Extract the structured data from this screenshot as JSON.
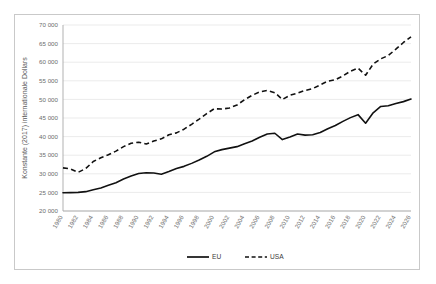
{
  "chart_data": {
    "type": "line",
    "title": "",
    "xlabel": "",
    "ylabel": "Konstante (2017) internationale Dollars",
    "ylim": [
      20000,
      70000
    ],
    "ytick_step": 5000,
    "ytick_labels": [
      "20 000",
      "25 000",
      "30 000",
      "35 000",
      "40 000",
      "45 000",
      "50 000",
      "55 000",
      "60 000",
      "65 000",
      "70 000"
    ],
    "ytick_values": [
      20000,
      25000,
      30000,
      35000,
      40000,
      45000,
      50000,
      55000,
      60000,
      65000,
      70000
    ],
    "grid": true,
    "legend_position": "bottom",
    "x": [
      1980,
      1981,
      1982,
      1983,
      1984,
      1985,
      1986,
      1987,
      1988,
      1989,
      1990,
      1991,
      1992,
      1993,
      1994,
      1995,
      1996,
      1997,
      1998,
      1999,
      2000,
      2001,
      2002,
      2003,
      2004,
      2005,
      2006,
      2007,
      2008,
      2009,
      2010,
      2011,
      2012,
      2013,
      2014,
      2015,
      2016,
      2017,
      2018,
      2019,
      2020,
      2021,
      2022,
      2023,
      2024,
      2025,
      2026
    ],
    "xtick_labels": [
      "1980",
      "1982",
      "1984",
      "1986",
      "1988",
      "1990",
      "1992",
      "1994",
      "1996",
      "1998",
      "2000",
      "2002",
      "2004",
      "2006",
      "2008",
      "2010",
      "2012",
      "2014",
      "2016",
      "2018",
      "2020",
      "2022",
      "2024",
      "2026"
    ],
    "series": [
      {
        "name": "EU",
        "style": "solid",
        "color": "#111111",
        "values": [
          24900,
          24950,
          25000,
          25200,
          25700,
          26200,
          26900,
          27600,
          28600,
          29400,
          30100,
          30300,
          30200,
          29900,
          30600,
          31400,
          32000,
          32800,
          33700,
          34700,
          35900,
          36500,
          36900,
          37300,
          38100,
          38800,
          39800,
          40700,
          40900,
          39200,
          39900,
          40700,
          40400,
          40500,
          41100,
          42100,
          43000,
          44100,
          45100,
          45900,
          43600,
          46400,
          48100,
          48300,
          48900,
          49400,
          50100
        ]
      },
      {
        "name": "USA",
        "style": "dashed",
        "color": "#111111",
        "values": [
          31600,
          31300,
          30400,
          31400,
          33300,
          34300,
          35100,
          36100,
          37300,
          38200,
          38500,
          38000,
          38800,
          39400,
          40500,
          41000,
          42000,
          43300,
          44700,
          46200,
          47500,
          47400,
          47700,
          48500,
          49900,
          51100,
          52000,
          52400,
          51800,
          50000,
          51100,
          51700,
          52400,
          52900,
          53900,
          54900,
          55300,
          56300,
          57600,
          58400,
          56500,
          59500,
          60900,
          61800,
          63500,
          65300,
          66800
        ]
      }
    ]
  },
  "legend": {
    "items": [
      {
        "label": "EU",
        "style": "solid"
      },
      {
        "label": "USA",
        "style": "dashed"
      }
    ]
  }
}
